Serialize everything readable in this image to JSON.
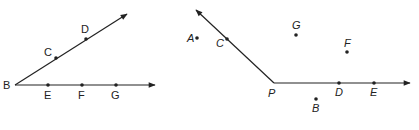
{
  "figures": [
    {
      "name": "angle-B",
      "vertex": {
        "label": "B",
        "x": 15,
        "y": 85,
        "lx": 3,
        "ly": 89
      },
      "rays": [
        {
          "from": [
            15,
            85
          ],
          "to": [
            127,
            14
          ]
        },
        {
          "from": [
            15,
            85
          ],
          "to": [
            155,
            85
          ]
        }
      ],
      "points": [
        {
          "label": "C",
          "x": 56,
          "y": 58,
          "lx": 44,
          "ly": 56
        },
        {
          "label": "D",
          "x": 86,
          "y": 39,
          "lx": 81,
          "ly": 33
        },
        {
          "label": "E",
          "x": 48,
          "y": 85,
          "lx": 44,
          "ly": 99
        },
        {
          "label": "F",
          "x": 82,
          "y": 85,
          "lx": 78,
          "ly": 99
        },
        {
          "label": "G",
          "x": 116,
          "y": 85,
          "lx": 111,
          "ly": 99
        }
      ]
    },
    {
      "name": "angle-P",
      "vertex": {
        "label": "P",
        "x": 274,
        "y": 83,
        "lx": 268,
        "ly": 97
      },
      "rays": [
        {
          "from": [
            274,
            83
          ],
          "to": [
            196,
            10
          ]
        },
        {
          "from": [
            274,
            83
          ],
          "to": [
            410,
            83
          ]
        }
      ],
      "points": [
        {
          "label": "C",
          "x": 227,
          "y": 39,
          "lx": 216,
          "ly": 47
        },
        {
          "label": "A",
          "x": 197,
          "y": 38,
          "lx": 187,
          "ly": 42,
          "off": true
        },
        {
          "label": "G",
          "x": 296,
          "y": 35,
          "lx": 292,
          "ly": 29,
          "off": true
        },
        {
          "label": "F",
          "x": 347,
          "y": 52,
          "lx": 344,
          "ly": 47,
          "off": true
        },
        {
          "label": "D",
          "x": 339,
          "y": 83,
          "lx": 335,
          "ly": 96
        },
        {
          "label": "E",
          "x": 374,
          "y": 83,
          "lx": 370,
          "ly": 96
        },
        {
          "label": "B",
          "x": 316,
          "y": 99,
          "lx": 312,
          "ly": 112,
          "off": true
        }
      ]
    }
  ]
}
